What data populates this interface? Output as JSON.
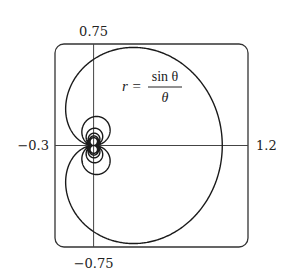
{
  "chart_data": {
    "type": "line",
    "subtype": "polar-curve",
    "title": "",
    "equation": "r = sin θ / θ",
    "annotation": {
      "lhs": "r =",
      "numerator": "sin θ",
      "denominator": "θ"
    },
    "xlabel": "",
    "ylabel": "",
    "xlim": [
      -0.3,
      1.2
    ],
    "ylim": [
      -0.75,
      0.75
    ],
    "tick_labels": {
      "x_min": "−0.3",
      "x_max": "1.2",
      "y_max": "0.75",
      "y_min": "−0.75"
    },
    "theta_range": [
      -18.85,
      18.85
    ],
    "grid": false,
    "legend": null,
    "series": [
      {
        "name": "r = sin θ / θ",
        "description": "Polar curve drawn for θ from about −6π to 6π; large outer loop passes near (1,0), inner loops shrink toward the origin",
        "sample_points": [
          {
            "theta": 0.01,
            "x": 1.0,
            "y": 0.01
          },
          {
            "theta": 0.785,
            "x": 0.637,
            "y": 0.637
          },
          {
            "theta": 1.571,
            "x": 0.0,
            "y": 0.637
          },
          {
            "theta": 2.356,
            "x": -0.212,
            "y": 0.212
          },
          {
            "theta": 3.142,
            "x": 0.0,
            "y": 0.0
          },
          {
            "theta": 4.712,
            "x": 0.0,
            "y": 0.212
          },
          {
            "theta": 7.854,
            "x": 0.0,
            "y": 0.127
          }
        ],
        "color": "#1a1a1a"
      }
    ],
    "frame": {
      "style": "rounded-rectangle",
      "color": "#333333"
    }
  }
}
